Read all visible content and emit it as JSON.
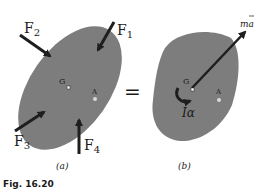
{
  "figure": {
    "caption": "Fig. 16.20",
    "body_color": "#7d7d7d",
    "arrow_color": "#1e1e1e",
    "panel_a": {
      "sublabel": "(a)",
      "point_g": "G",
      "point_a": "A",
      "forces": [
        {
          "name": "F",
          "sub": "1"
        },
        {
          "name": "F",
          "sub": "2"
        },
        {
          "name": "F",
          "sub": "3"
        },
        {
          "name": "F",
          "sub": "4"
        }
      ]
    },
    "equals": "=",
    "panel_b": {
      "sublabel": "(b)",
      "point_g": "G",
      "point_a": "A",
      "inertia_vector": "ma",
      "inertia_couple": "Iα"
    }
  }
}
